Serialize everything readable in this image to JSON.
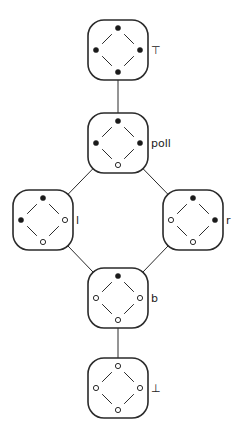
{
  "diagram": {
    "type": "lattice",
    "colors": {
      "stroke": "#2a2a2a",
      "filled": "#1a1a1a",
      "hollow": "#ffffff"
    },
    "nodes": [
      {
        "id": "top",
        "label": "⊤",
        "cx": 118,
        "cy": 50,
        "dots": {
          "top": "filled",
          "left": "filled",
          "right": "filled",
          "bottom": "filled"
        }
      },
      {
        "id": "poll",
        "label": "poll",
        "cx": 118,
        "cy": 143,
        "dots": {
          "top": "filled",
          "left": "filled",
          "right": "filled",
          "bottom": "hollow"
        }
      },
      {
        "id": "l",
        "label": "l",
        "cx": 43,
        "cy": 220,
        "dots": {
          "top": "filled",
          "left": "filled",
          "right": "hollow",
          "bottom": "hollow"
        }
      },
      {
        "id": "r",
        "label": "r",
        "cx": 193,
        "cy": 220,
        "dots": {
          "top": "filled",
          "left": "hollow",
          "right": "filled",
          "bottom": "hollow"
        }
      },
      {
        "id": "b",
        "label": "b",
        "cx": 118,
        "cy": 298,
        "dots": {
          "top": "filled",
          "left": "hollow",
          "right": "hollow",
          "bottom": "hollow"
        }
      },
      {
        "id": "bottom",
        "label": "⊥",
        "cx": 118,
        "cy": 388,
        "dots": {
          "top": "hollow",
          "left": "hollow",
          "right": "hollow",
          "bottom": "hollow"
        }
      }
    ],
    "edges": [
      {
        "from": "top",
        "to": "poll"
      },
      {
        "from": "poll",
        "to": "l"
      },
      {
        "from": "poll",
        "to": "r"
      },
      {
        "from": "l",
        "to": "b"
      },
      {
        "from": "r",
        "to": "b"
      },
      {
        "from": "b",
        "to": "bottom"
      }
    ]
  }
}
